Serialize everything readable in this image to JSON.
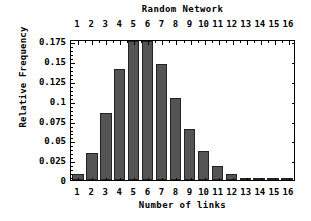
{
  "chart_data": {
    "type": "bar",
    "title": "Random Network",
    "xlabel": "Number of links",
    "ylabel": "Relative Frequency",
    "categories": [
      "1",
      "2",
      "3",
      "4",
      "5",
      "6",
      "7",
      "8",
      "9",
      "10",
      "11",
      "12",
      "13",
      "14",
      "15",
      "16"
    ],
    "values": [
      0.007,
      0.034,
      0.085,
      0.14,
      0.175,
      0.175,
      0.146,
      0.104,
      0.064,
      0.036,
      0.018,
      0.008,
      0.003,
      0.0012,
      0.0008,
      0.0008
    ],
    "ytick_labels": [
      "0",
      "0.025",
      "0.05",
      "0.075",
      "0.1",
      "0.125",
      "0.15",
      "0.175"
    ],
    "ytick_values": [
      0,
      0.025,
      0.05,
      0.075,
      0.1,
      0.125,
      0.15,
      0.175
    ],
    "ylim": [
      0,
      0.178
    ],
    "xlim": [
      0.5,
      16.5
    ],
    "grid": false,
    "legend": null,
    "top_axis_labels": [
      "1",
      "2",
      "3",
      "4",
      "5",
      "6",
      "7",
      "8",
      "9",
      "10",
      "11",
      "12",
      "13",
      "14",
      "15",
      "16"
    ],
    "bar_color": "#545454",
    "bar_edge_color": "#232323",
    "frame_color": "#000000",
    "background_color": "#ffffff"
  }
}
